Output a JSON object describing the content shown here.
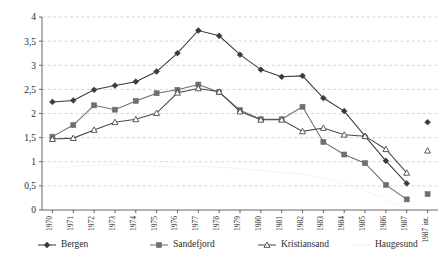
{
  "chart_data": {
    "type": "line",
    "title": "",
    "subtitle": "",
    "xlabel": "",
    "ylabel": "",
    "ylim": [
      0,
      4
    ],
    "y_ticks": [
      "0",
      "0,5",
      "1",
      "1,5",
      "2",
      "2,5",
      "3",
      "3,5",
      "4"
    ],
    "y_tick_values": [
      0,
      0.5,
      1,
      1.5,
      2,
      2.5,
      3,
      3.5,
      4
    ],
    "grid": "horizontal-dashed",
    "legend_position": "bottom",
    "categories": [
      "1970",
      "1971",
      "1972",
      "1973",
      "1974",
      "1975",
      "1976",
      "1977",
      "1978",
      "1979",
      "1980",
      "1981",
      "1982",
      "1983",
      "1984",
      "1985",
      "1986",
      "1987",
      "1987 int."
    ],
    "series": [
      {
        "name": "Bergen",
        "marker": "filled-diamond",
        "color": "#3a3a3a",
        "values": [
          2.24,
          2.27,
          2.49,
          2.58,
          2.66,
          2.87,
          3.25,
          3.72,
          3.61,
          3.22,
          2.91,
          2.76,
          2.78,
          2.32,
          2.05,
          1.53,
          1.02,
          0.55,
          null
        ],
        "endpoint_value": 1.82
      },
      {
        "name": "Sandefjord",
        "marker": "filled-square",
        "color": "#6e6e6e",
        "values": [
          1.52,
          1.76,
          2.17,
          2.08,
          2.26,
          2.42,
          2.49,
          2.6,
          2.44,
          2.07,
          1.88,
          1.88,
          2.14,
          1.41,
          1.15,
          0.97,
          0.52,
          0.22,
          null
        ],
        "endpoint_value": 0.33
      },
      {
        "name": "Kristiansand",
        "marker": "open-triangle",
        "color": "#4a4a4a",
        "values": [
          1.47,
          1.49,
          1.66,
          1.82,
          1.88,
          2.01,
          2.43,
          2.52,
          2.45,
          2.04,
          1.87,
          1.87,
          1.63,
          1.7,
          1.56,
          1.53,
          1.26,
          0.77,
          null
        ],
        "endpoint_value": 1.23
      },
      {
        "name": "Haugesund",
        "marker": "none",
        "color": "#f2f2f2",
        "values": [
          0.88,
          0.9,
          0.93,
          0.95,
          0.92,
          0.9,
          0.89,
          0.9,
          0.89,
          0.86,
          0.82,
          0.78,
          0.74,
          0.66,
          0.55,
          0.4,
          0.22,
          0.05,
          null
        ],
        "endpoint_value": null
      }
    ]
  },
  "legend": {
    "items": [
      {
        "label": "Bergen",
        "marker": "filled-diamond"
      },
      {
        "label": "Sandefjord",
        "marker": "filled-square"
      },
      {
        "label": "Kristiansand",
        "marker": "open-triangle"
      },
      {
        "label": "Haugesund",
        "marker": "faint-line"
      }
    ]
  }
}
